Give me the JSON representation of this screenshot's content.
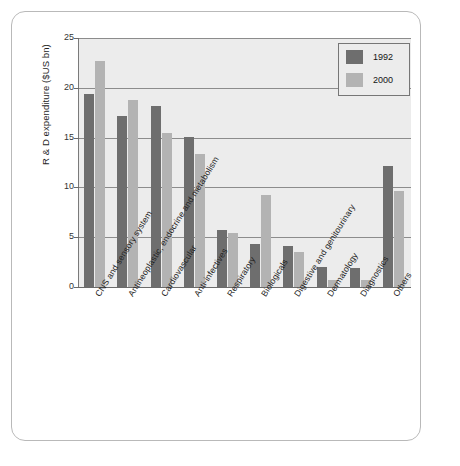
{
  "chart_data": {
    "type": "bar",
    "title": "",
    "xlabel": "",
    "ylabel": "R & D expenditure ($US bn)",
    "ylim": [
      0,
      25
    ],
    "yticks": [
      0,
      5,
      10,
      15,
      20,
      25
    ],
    "ytick_labels": [
      "0",
      "5",
      "10",
      "15",
      "20",
      "25"
    ],
    "grid": "horizontal",
    "legend_position": "top-right",
    "categories": [
      "CNS and sensory system",
      "Antineoplastic, endocrine and metabolism",
      "Cardiovascular",
      "Anti-infectives",
      "Respiratory",
      "Biologicals",
      "Digestive and genitourinary",
      "Dermatology",
      "Diagnostics",
      "Others"
    ],
    "series": [
      {
        "name": "1992",
        "color": "#6e6e6e",
        "values": [
          19.4,
          17.2,
          18.2,
          15.1,
          5.7,
          4.3,
          4.1,
          2.0,
          1.9,
          12.1
        ]
      },
      {
        "name": "2000",
        "color": "#b3b3b3",
        "values": [
          22.7,
          18.8,
          15.5,
          13.4,
          5.4,
          9.2,
          3.5,
          0.75,
          0.75,
          9.6
        ]
      }
    ]
  },
  "legend": {
    "entries": [
      {
        "label": "1992",
        "color": "#6e6e6e"
      },
      {
        "label": "2000",
        "color": "#b3b3b3"
      }
    ]
  },
  "axes": {
    "y_title": "R & D expenditure ($US bn)",
    "y_tick_labels": [
      "25",
      "20",
      "15",
      "10",
      "5",
      "0"
    ]
  },
  "colors": {
    "plot_background": "#ececec",
    "page_background": "#ffffff",
    "frame_border": "#b9b9b9",
    "gridline": "#8c8c8c",
    "axis": "#6b6b6b",
    "series_1992": "#6e6e6e",
    "series_2000": "#b3b3b3"
  }
}
